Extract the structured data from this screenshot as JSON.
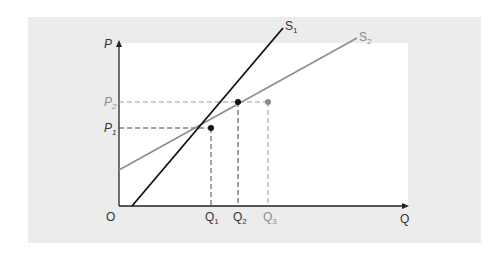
{
  "diagram": {
    "axes": {
      "y_label": "P",
      "x_label": "Q",
      "origin_label": "O"
    },
    "curves": [
      {
        "name": "S1",
        "label": "S",
        "sub": "1",
        "color": "#111111"
      },
      {
        "name": "S2",
        "label": "S",
        "sub": "2",
        "color": "#8c8c8c"
      }
    ],
    "price_labels": [
      {
        "label": "P",
        "sub": "1",
        "color": "#333333"
      },
      {
        "label": "P",
        "sub": "2",
        "color": "#8c8c8c"
      }
    ],
    "quantity_labels": [
      {
        "label": "Q",
        "sub": "1",
        "color": "#333333"
      },
      {
        "label": "Q",
        "sub": "2",
        "color": "#333333"
      },
      {
        "label": "Q",
        "sub": "3",
        "color": "#8c8c8c"
      }
    ],
    "colors": {
      "panel_bg": "#ececec",
      "plot_bg": "#ffffff",
      "primary": "#111111",
      "secondary": "#8c8c8c"
    }
  }
}
